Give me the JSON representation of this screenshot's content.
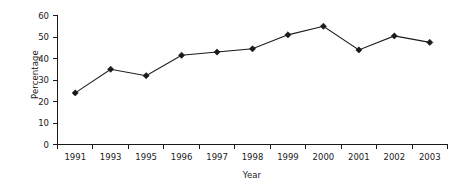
{
  "chart_data": {
    "type": "line",
    "title": "",
    "subtitle": "",
    "xlabel": "Year",
    "ylabel": "Percentage",
    "categories": [
      "1991",
      "1993",
      "1995",
      "1996",
      "1997",
      "1998",
      "1999",
      "2000",
      "2001",
      "2002",
      "2003"
    ],
    "values": [
      24,
      35,
      32,
      41.5,
      43,
      44.5,
      51,
      55,
      44,
      50.5,
      47.5
    ],
    "series": [
      {
        "name": "Percentage",
        "values": [
          24,
          35,
          32,
          41.5,
          43,
          44.5,
          51,
          55,
          44,
          50.5,
          47.5
        ]
      }
    ],
    "ylim": [
      0,
      60
    ],
    "yticks": [
      0,
      10,
      20,
      30,
      40,
      50,
      60
    ],
    "ytick_labels": [
      "0",
      "10",
      "20",
      "30",
      "40",
      "50",
      "60"
    ],
    "xtick_labels": [
      "1991",
      "1993",
      "1995",
      "1996",
      "1997",
      "1998",
      "1999",
      "2000",
      "2001",
      "2002",
      "2003"
    ],
    "grid": false,
    "legend": false,
    "legend_position": "none",
    "marker": "diamond",
    "line_color": "#1a1a1a",
    "marker_color": "#1a1a1a",
    "background_color": "#ffffff",
    "annotations": []
  },
  "axes": {
    "y_title": "Percentage",
    "x_title": "Year"
  }
}
